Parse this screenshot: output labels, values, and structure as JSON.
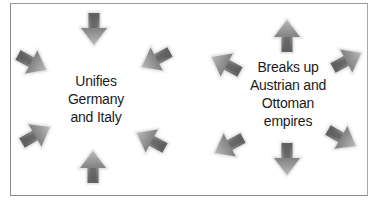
{
  "diagram": {
    "panels": [
      {
        "id": "left",
        "label_lines": [
          "Unifies",
          "Germany",
          "and Italy"
        ],
        "arrow_direction": "inward",
        "arrow_count": 6
      },
      {
        "id": "right",
        "label_lines": [
          "Breaks up",
          "Austrian and",
          "Ottoman",
          "empires"
        ],
        "arrow_direction": "outward",
        "arrow_count": 8
      }
    ],
    "colors": {
      "border": "#8a8a8a",
      "arrow_dark": "#6e6e6e",
      "arrow_light": "#b4b4b4",
      "arrow_glow": "#d9d9d9",
      "text": "#1a1a1a",
      "background": "#ffffff"
    }
  }
}
